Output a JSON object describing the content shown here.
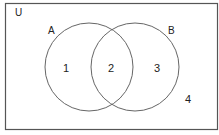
{
  "diagram": {
    "type": "venn",
    "universe_label": "U",
    "sets": [
      {
        "label": "A"
      },
      {
        "label": "B"
      }
    ],
    "regions": [
      {
        "id": "only-a",
        "label": "1"
      },
      {
        "id": "a-and-b",
        "label": "2"
      },
      {
        "id": "only-b",
        "label": "3"
      },
      {
        "id": "outside",
        "label": "4"
      }
    ],
    "colors": {
      "stroke": "#555555",
      "background": "#ffffff",
      "text": "#222222"
    }
  }
}
